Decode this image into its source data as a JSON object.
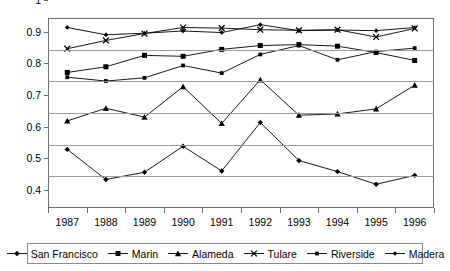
{
  "chart_data": {
    "type": "line",
    "title": "",
    "xlabel": "",
    "ylabel": "",
    "categories": [
      "1987",
      "1988",
      "1989",
      "1990",
      "1991",
      "1992",
      "1993",
      "1994",
      "1995",
      "1996"
    ],
    "ylim": [
      0.4,
      1.0
    ],
    "yticks": [
      "0.4",
      "0.5",
      "0.6",
      "0.7",
      "0.8",
      "0.9",
      "1"
    ],
    "ytick_values": [
      0.4,
      0.5,
      0.6,
      0.7,
      0.8,
      0.9,
      1.0
    ],
    "grid": true,
    "legend_position": "bottom",
    "series": [
      {
        "name": "San Francisco",
        "marker": "diamond",
        "color": "#000000",
        "values": [
          0.585,
          0.49,
          0.513,
          0.595,
          0.517,
          0.67,
          0.55,
          0.515,
          0.475,
          0.503
        ]
      },
      {
        "name": "Marin",
        "marker": "square",
        "color": "#000000",
        "values": [
          0.828,
          0.846,
          0.882,
          0.879,
          0.901,
          0.913,
          0.916,
          0.911,
          0.891,
          0.866
        ]
      },
      {
        "name": "Alameda",
        "marker": "triangle",
        "color": "#000000",
        "values": [
          0.675,
          0.715,
          0.687,
          0.783,
          0.667,
          0.805,
          0.693,
          0.697,
          0.713,
          0.788
        ]
      },
      {
        "name": "Tulare",
        "marker": "x",
        "color": "#000000",
        "values": [
          0.903,
          0.929,
          0.951,
          0.97,
          0.968,
          0.963,
          0.961,
          0.963,
          0.94,
          0.967
        ]
      },
      {
        "name": "Riverside",
        "marker": "small-square",
        "color": "#000000",
        "values": [
          0.813,
          0.801,
          0.811,
          0.85,
          0.826,
          0.885,
          0.913,
          0.868,
          0.894,
          0.905
        ]
      },
      {
        "name": "Madera",
        "marker": "small-diamond",
        "color": "#000000",
        "values": [
          0.97,
          0.947,
          0.952,
          0.959,
          0.954,
          0.979,
          0.96,
          0.962,
          0.96,
          0.97
        ]
      }
    ]
  },
  "legend": {
    "items": [
      {
        "label": "San Francisco",
        "marker": "diamond"
      },
      {
        "label": "Marin",
        "marker": "square"
      },
      {
        "label": "Alameda",
        "marker": "triangle"
      },
      {
        "label": "Tulare",
        "marker": "x"
      },
      {
        "label": "Riverside",
        "marker": "small-square"
      },
      {
        "label": "Madera",
        "marker": "small-diamond"
      }
    ]
  }
}
